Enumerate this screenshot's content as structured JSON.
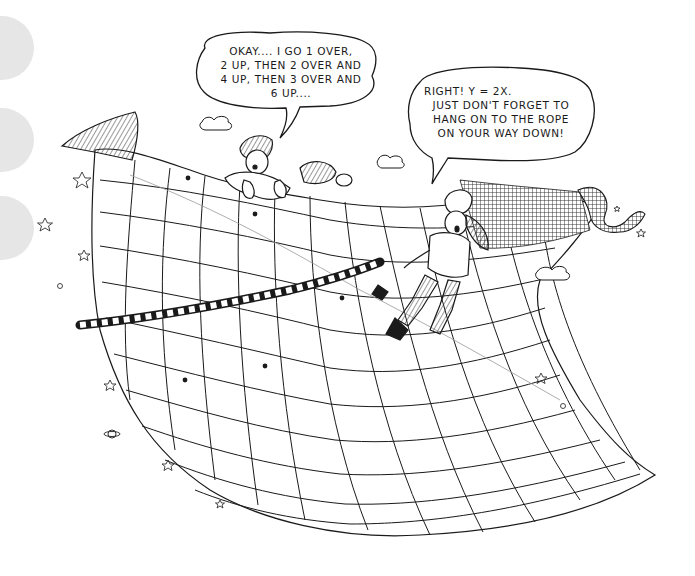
{
  "illustration": {
    "subject": "two children on a curved coordinate grid sheet in space, one pulling a rope along the line y = 2x",
    "binder_holes": 3
  },
  "speech_bubbles": [
    {
      "speaker": "child-on-top-edge",
      "lines": [
        "OKAY.... I GO 1 OVER,",
        "2 UP, THEN 2 OVER AND",
        "4 UP, THEN 3 OVER AND",
        "6 UP...."
      ]
    },
    {
      "speaker": "child-pulling-rope",
      "lines": [
        "RIGHT!  Y = 2X.",
        "JUST DON'T FORGET TO",
        "HANG ON TO THE ROPE",
        "ON YOUR WAY DOWN!"
      ]
    }
  ],
  "decorations": {
    "stars": 9,
    "clouds": 3,
    "planet": "saturn-like",
    "small_circles": 3
  },
  "colors": {
    "ink": "#1a1a1a",
    "paper": "#ffffff",
    "hole": "#e6e6e6"
  }
}
